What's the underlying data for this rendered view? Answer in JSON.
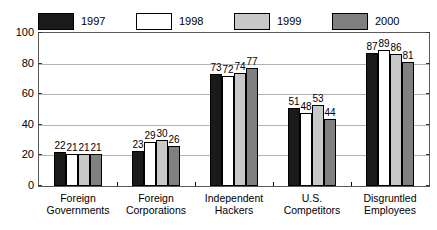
{
  "chart_data": {
    "type": "bar",
    "title": "",
    "xlabel": "",
    "ylabel": "",
    "ylim": [
      0,
      100
    ],
    "yticks": [
      0,
      20,
      40,
      60,
      80,
      100
    ],
    "grid": true,
    "legend_position": "top",
    "categories": [
      [
        "Foreign",
        "Governments"
      ],
      [
        "Foreign",
        "Corporations"
      ],
      [
        "Independent",
        "Hackers"
      ],
      [
        "U.S.",
        "Competitors"
      ],
      [
        "Disgruntled",
        "Employees"
      ]
    ],
    "series": [
      {
        "name": "1997",
        "color": "#1a1a1a",
        "values": [
          22,
          23,
          73,
          51,
          87
        ]
      },
      {
        "name": "1998",
        "color": "#ffffff",
        "values": [
          21,
          29,
          72,
          48,
          89
        ]
      },
      {
        "name": "1999",
        "color": "#c8c8c8",
        "values": [
          21,
          30,
          74,
          53,
          86
        ]
      },
      {
        "name": "2000",
        "color": "#808080",
        "values": [
          21,
          26,
          77,
          44,
          81
        ]
      }
    ]
  },
  "legend": {
    "items": [
      {
        "label": "1997",
        "color": "#1a1a1a"
      },
      {
        "label": "1998",
        "color": "#ffffff"
      },
      {
        "label": "1999",
        "color": "#c8c8c8"
      },
      {
        "label": "2000",
        "color": "#808080"
      }
    ]
  }
}
